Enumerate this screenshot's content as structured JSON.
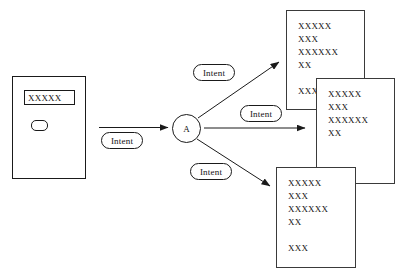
{
  "diagram": {
    "type": "flow-diagram",
    "background_color": "#ffffff",
    "stroke_color": "#1a1a1a",
    "caption": "",
    "form": {
      "field_value": "XXXXX",
      "button_label": ""
    },
    "node": {
      "label": "A"
    },
    "edges": [
      {
        "label": "Intent",
        "from": "form",
        "to": "node",
        "direction": "right"
      },
      {
        "label": "Intent",
        "from": "node",
        "to": "document-top",
        "direction": "up-right"
      },
      {
        "label": "Intent",
        "from": "node",
        "to": "document-middle",
        "direction": "right"
      },
      {
        "label": "Intent",
        "from": "node",
        "to": "document-bottom",
        "direction": "down-right"
      }
    ],
    "documents": [
      {
        "name": "document-top",
        "lines": [
          "XXXXX",
          "XXX",
          "XXXXXX",
          "XX",
          "",
          "XXX"
        ]
      },
      {
        "name": "document-middle",
        "lines": [
          "XXXXX",
          "XXX",
          "XXXXXX",
          "XX"
        ]
      },
      {
        "name": "document-bottom",
        "lines": [
          "XXXXX",
          "XXX",
          "XXXXXX",
          "XX",
          "",
          "XXX"
        ]
      }
    ]
  }
}
